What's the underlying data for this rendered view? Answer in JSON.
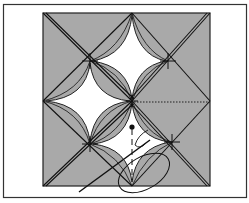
{
  "figure": {
    "type": "quilt-block-diagram",
    "colors": {
      "background": "#ffffff",
      "block_fill": "#a9a9a9",
      "petal_fill": "#ffffff",
      "line": "#1a1a1a"
    },
    "elements": {
      "frame": "outer rectangular border",
      "block": "gray square",
      "petals": [
        "top",
        "left",
        "bottom-center"
      ],
      "cross_marks": 4,
      "dotted_seam": "horizontal stitched seam from center to right edge",
      "needle": "diagonal needle with thread loop at bottom"
    }
  }
}
